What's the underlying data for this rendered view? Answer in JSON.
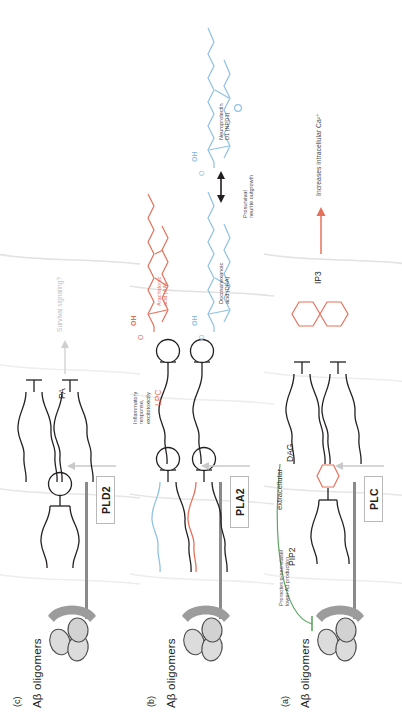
{
  "figure": {
    "colors": {
      "orange": "#e8705a",
      "blue": "#8fc2e3",
      "green": "#5fa564",
      "gray_membrane": "#8a8a8a",
      "gray_faint": "#d9d9d9",
      "text": "#231f20"
    }
  },
  "panel_a": {
    "letter": "(a)",
    "receptor_label": "Aβ oligomers",
    "inhibition_note": "Promotes α-secretase/\nlower Aβ production",
    "extracellular_label": "extracellular",
    "substrate_label": "PIP2",
    "product_label": "DAG",
    "enzyme": "PLC",
    "second_messenger": "IP3",
    "outcome": "Increases intracellular Ca²⁺"
  },
  "panel_b": {
    "letter": "(b)",
    "receptor_label": "Aβ oligomers",
    "enzyme": "PLA2",
    "product_lyso": "LPC",
    "product_aa_label": "Arachidonic\nacid (AA)",
    "aa_headgroup": "OH",
    "aa_carbonyl": "O",
    "aa_outcome": "Inflammatory\nresponse,\nexcitotoxicity",
    "product_dha_label": "Docosahexanoic\nacid (DHA)",
    "dha_headgroup": "OH",
    "dha_carbonyl": "O",
    "product_npd1_label": "Neuroprotectin\nD1 (NPD1)",
    "npd1_headgroup": "OH",
    "npd1_carbonyl": "O",
    "npd1_ether_o": "O",
    "outcome": "Prosurvival\nneurite outgrowth"
  },
  "panel_c": {
    "letter": "(c)",
    "receptor_label": "Aβ oligomers",
    "enzyme": "PLD2",
    "product_label": "PA",
    "outcome": "Survival signaling?"
  }
}
